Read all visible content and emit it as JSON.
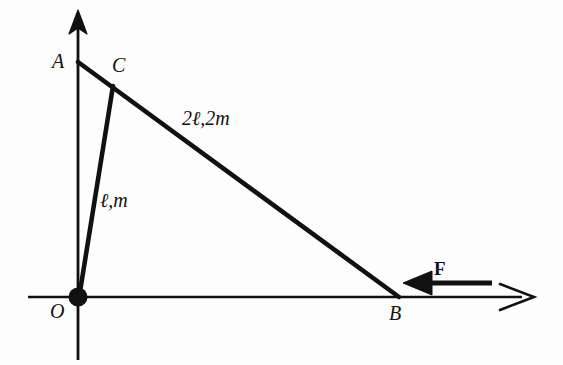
{
  "figure": {
    "background_color": "#fdfdfd",
    "ink_color": "#111111",
    "width": 563,
    "height": 365
  },
  "axes": {
    "x_axis": {
      "name": "horizontal-axis",
      "from": [
        28,
        297
      ],
      "to": [
        535,
        297
      ],
      "arrowhead": "open-right",
      "stroke_width": 2.4
    },
    "y_axis": {
      "name": "vertical-axis",
      "from": [
        78,
        360
      ],
      "to": [
        78,
        12
      ],
      "arrowhead": "solid-up",
      "stroke_width": 2.6
    }
  },
  "points": [
    {
      "id": "A",
      "label": "A",
      "x": 78,
      "y": 62,
      "marker": "none"
    },
    {
      "id": "C",
      "label": "C",
      "x": 113,
      "y": 87,
      "marker": "none"
    },
    {
      "id": "O",
      "label": "O",
      "x": 78,
      "y": 297,
      "marker": "filled-dot"
    },
    {
      "id": "B",
      "label": "B",
      "x": 398,
      "y": 297,
      "marker": "none"
    }
  ],
  "origin_marker": {
    "name": "origin-pivot-dot",
    "cx": 78,
    "cy": 297,
    "r": 9,
    "fill": "#111111"
  },
  "rods": [
    {
      "id": "AB",
      "name": "rod-AB",
      "from": [
        78,
        62
      ],
      "to": [
        398,
        297
      ],
      "label": "2ℓ,2m",
      "stroke_width": 4.6
    },
    {
      "id": "OC",
      "name": "rod-OC",
      "from": [
        78,
        297
      ],
      "to": [
        113,
        87
      ],
      "label": "ℓ,m",
      "stroke_width": 4.6
    }
  ],
  "force": {
    "name": "force-arrow-F",
    "label": "F",
    "direction": "left",
    "tail": [
      492,
      283
    ],
    "head": [
      404,
      283
    ],
    "stroke_width": 5.5,
    "applied_at": "B"
  },
  "labels": {
    "point_A": "A",
    "point_B": "B",
    "point_C": "C",
    "point_O": "O",
    "rod_long": "2ℓ,2m",
    "rod_short": "ℓ,m",
    "force": "F"
  }
}
